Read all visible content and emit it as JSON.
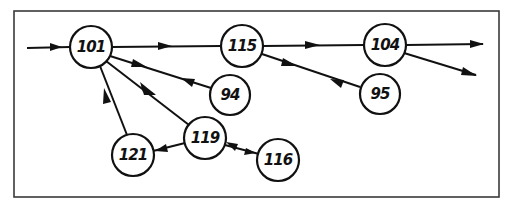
{
  "diagram": {
    "type": "directed-graph",
    "frame": {
      "x": 14,
      "y": 11,
      "width": 485,
      "height": 186
    },
    "colors": {
      "stroke": "#111111",
      "frame": "#3a3a3a",
      "background": "#ffffff"
    },
    "nodes": [
      {
        "id": "101",
        "label": "101",
        "cx": 91,
        "cy": 47
      },
      {
        "id": "115",
        "label": "115",
        "cx": 242,
        "cy": 46
      },
      {
        "id": "104",
        "label": "104",
        "cx": 385,
        "cy": 45
      },
      {
        "id": "94",
        "label": "94",
        "cx": 230,
        "cy": 95
      },
      {
        "id": "95",
        "label": "95",
        "cx": 380,
        "cy": 94
      },
      {
        "id": "119",
        "label": "119",
        "cx": 205,
        "cy": 138
      },
      {
        "id": "121",
        "label": "121",
        "cx": 133,
        "cy": 155
      },
      {
        "id": "116",
        "label": "116",
        "cx": 278,
        "cy": 160
      }
    ],
    "edges": [
      {
        "from": "input",
        "to": "101",
        "note": "incoming arrow from left"
      },
      {
        "from": "101",
        "to": "115"
      },
      {
        "from": "115",
        "to": "104"
      },
      {
        "from": "104",
        "to": "output-1",
        "note": "outgoing arrow to right"
      },
      {
        "from": "104",
        "to": "output-2",
        "note": "outgoing arrow down-right"
      },
      {
        "from": "101",
        "to": "94",
        "note": "bidirectional arrows"
      },
      {
        "from": "94",
        "to": "101"
      },
      {
        "from": "115",
        "to": "95",
        "note": "bidirectional arrows"
      },
      {
        "from": "95",
        "to": "115"
      },
      {
        "from": "101",
        "to": "119"
      },
      {
        "from": "119",
        "to": "121"
      },
      {
        "from": "121",
        "to": "101"
      },
      {
        "from": "119",
        "to": "116",
        "note": "bidirectional arrows"
      },
      {
        "from": "116",
        "to": "119"
      }
    ]
  }
}
